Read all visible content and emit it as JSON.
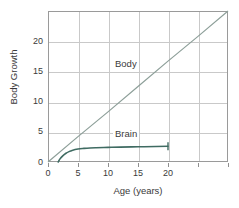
{
  "chart_data": {
    "type": "line",
    "title": "",
    "xlabel": "Age (years)",
    "ylabel": "Body Growth",
    "xlim": [
      0,
      30
    ],
    "ylim": [
      0,
      25
    ],
    "grid": true,
    "legend_position": "inline-annotation",
    "x_ticks": [
      0,
      5,
      10,
      15,
      20
    ],
    "x_tick_labels": [
      "0",
      "5",
      "10",
      "15",
      "20"
    ],
    "y_ticks": [
      0,
      5,
      10,
      15,
      20
    ],
    "y_tick_labels": [
      "0",
      "5",
      "10",
      "15",
      "20"
    ],
    "series": [
      {
        "name": "Body",
        "color": "#8d9f99",
        "annotation": "Body",
        "annotation_at": {
          "x": 13.0,
          "y": 16.2
        },
        "x": [
          0,
          5,
          10,
          15,
          20,
          25,
          30
        ],
        "values": [
          0,
          4.2,
          8.3,
          12.5,
          16.7,
          20.8,
          25.0
        ]
      },
      {
        "name": "Brain",
        "color": "#3f6b62",
        "annotation": "Brain",
        "annotation_at": {
          "x": 13.0,
          "y": 4.6
        },
        "x": [
          1.7,
          2.0,
          2.5,
          3.0,
          3.5,
          4.0,
          5.0,
          6.0,
          7.0,
          8.0,
          10.0,
          12.0,
          15.0,
          18.0,
          20.0
        ],
        "values": [
          0.0,
          0.52,
          1.05,
          1.45,
          1.72,
          1.92,
          2.15,
          2.25,
          2.32,
          2.36,
          2.42,
          2.47,
          2.52,
          2.57,
          2.6
        ]
      }
    ],
    "axis_ticks_visible": "x-bottom-outside"
  }
}
